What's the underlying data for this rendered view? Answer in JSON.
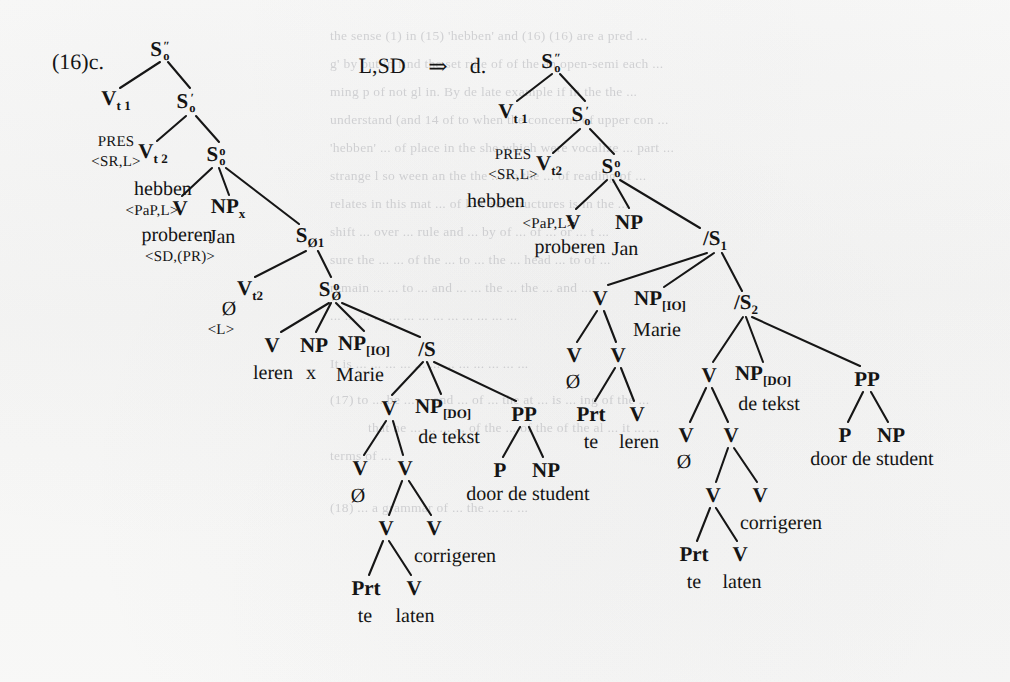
{
  "page": {
    "example_number": "(16)c.",
    "derivation_label": "L,SD",
    "derivation_arrow": "⇒",
    "result_label": "d.",
    "background_color": "#f7f7f6",
    "ink_color": "#141414"
  },
  "ghost_text": {
    "note": "faint bleed-through text from reverse page, illegible",
    "lines": [
      "the sense (1) in (15) 'hebben' and (16) (16) are a pred ...",
      "g' by but in find the set rule of of the an open-semi each ...",
      "ming p of not gl in. By de late example if in the the ...",
      "understand (and 14 of to when the concerns of upper con ...",
      "'hebben' ... of place in the she which were vocalize ... part ...",
      "strange l so ween an the the ... so the ... of reading of ...",
      "relates in this mat ... of low set structures is in the ...",
      "shift ... over ... rule and ... by of ... of ... or ... t ...",
      "sure the ... ... of the ... to ... the ... head ... to of ...",
      "remain ... ... to ... and ... ... the ... the ... and ...",
      "... ... ... ... ... ... ... ... ... ... ... ... ...",
      "It is ... ... ... ... ... ... ... ... ... ... ... ...",
      "(17) to ... be ... ... and ... of ... the at ... is ... ing of the ...",
      "that he ... ... ... ... of the ... of the of the al ... it ... ...",
      "terms of ...",
      "(18) ... a grammar of ... the ... ... ..."
    ]
  },
  "trees": {
    "left": {
      "name": "tree-16c",
      "nodes": [
        {
          "id": "l-S2",
          "label_html": "S<span class=\"stack\"><span class=\"up\">″</span><span class=\"down\">o</span></span>",
          "text": "S″o",
          "x": 160,
          "y": 50
        },
        {
          "id": "l-Vt1",
          "label_html": "V<span class=\"sub\">t</span><span class=\"sub\"> 1</span>",
          "text": "Vt1",
          "x": 116,
          "y": 100
        },
        {
          "id": "l-S1",
          "label_html": "S<span class=\"stack\"><span class=\"up\">′</span><span class=\"down\">o</span></span>",
          "text": "S′o",
          "x": 186,
          "y": 102
        },
        {
          "id": "l-Vt2",
          "label_html": "V<span class=\"sub\">t</span><span class=\"sub\"> 2</span>",
          "text": "Vt2",
          "x": 153,
          "y": 153
        },
        {
          "id": "l-S0",
          "label_html": "S<span class=\"stack\"><span class=\"up\">o</span><span class=\"down\">o</span></span>",
          "text": "S°o",
          "x": 216,
          "y": 155
        },
        {
          "id": "l-V1",
          "label_html": "V",
          "text": "V",
          "x": 180,
          "y": 208
        },
        {
          "id": "l-NPJan",
          "label_html": "NP<span class=\"sub\">x</span>",
          "text": "NPx",
          "x": 228,
          "y": 208
        },
        {
          "id": "l-Sp1",
          "label_html": "S<span class=\"sub\">Ø</span><span class=\"sub\">1</span>",
          "text": "S′Ø1",
          "x": 310,
          "y": 237
        },
        {
          "id": "l-Vt2b",
          "label_html": "V<span class=\"sub\">t</span><span class=\"sub\">2</span>",
          "text": "Vt2",
          "x": 250,
          "y": 290
        },
        {
          "id": "l-S0b",
          "label_html": "S<span class=\"stack\"><span class=\"up\">o</span><span class=\"down\">Ø</span></span>",
          "text": "S°Ø",
          "x": 330,
          "y": 290
        },
        {
          "id": "l-V2",
          "label_html": "V",
          "text": "V",
          "x": 272,
          "y": 345
        },
        {
          "id": "l-NPx2",
          "label_html": "NP",
          "text": "NP",
          "x": 314,
          "y": 345
        },
        {
          "id": "l-NPio",
          "label_html": "NP<span class=\"sub\">[IO]</span>",
          "text": "NP[IO]",
          "x": 364,
          "y": 345
        },
        {
          "id": "l-S3",
          "label_html": "/S",
          "text": "/S",
          "x": 427,
          "y": 349
        },
        {
          "id": "l-V3",
          "label_html": "V",
          "text": "V",
          "x": 389,
          "y": 408
        },
        {
          "id": "l-NPdo",
          "label_html": "NP<span class=\"sub\">[DO]</span>",
          "text": "NP[DO]",
          "x": 443,
          "y": 408
        },
        {
          "id": "l-PP",
          "label_html": "PP",
          "text": "PP",
          "x": 524,
          "y": 414
        },
        {
          "id": "l-V4",
          "label_html": "V",
          "text": "V",
          "x": 360,
          "y": 468
        },
        {
          "id": "l-V5",
          "label_html": "V",
          "text": "V",
          "x": 405,
          "y": 468
        },
        {
          "id": "l-P",
          "label_html": "P",
          "text": "P",
          "x": 500,
          "y": 470
        },
        {
          "id": "l-NPpp",
          "label_html": "NP",
          "text": "NP",
          "x": 546,
          "y": 470
        },
        {
          "id": "l-V6",
          "label_html": "V",
          "text": "V",
          "x": 386,
          "y": 528
        },
        {
          "id": "l-V7",
          "label_html": "V",
          "text": "V",
          "x": 434,
          "y": 528
        },
        {
          "id": "l-Prt",
          "label_html": "Prt",
          "text": "Prt",
          "x": 366,
          "y": 588
        },
        {
          "id": "l-V8",
          "label_html": "V",
          "text": "V",
          "x": 414,
          "y": 588
        }
      ],
      "edges": [
        [
          160,
          62,
          120,
          88
        ],
        [
          168,
          62,
          190,
          88
        ],
        [
          186,
          116,
          157,
          141
        ],
        [
          196,
          116,
          219,
          142
        ],
        [
          212,
          168,
          182,
          196
        ],
        [
          219,
          168,
          229,
          195
        ],
        [
          226,
          168,
          299,
          224
        ],
        [
          306,
          251,
          255,
          277
        ],
        [
          318,
          251,
          331,
          277
        ],
        [
          329,
          303,
          281,
          332
        ],
        [
          331,
          303,
          316,
          332
        ],
        [
          336,
          303,
          364,
          331
        ],
        [
          342,
          303,
          420,
          337
        ],
        [
          423,
          362,
          392,
          395
        ],
        [
          427,
          362,
          441,
          394
        ],
        [
          434,
          362,
          516,
          401
        ],
        [
          386,
          421,
          364,
          455
        ],
        [
          393,
          421,
          403,
          455
        ],
        [
          520,
          427,
          503,
          457
        ],
        [
          529,
          427,
          543,
          457
        ],
        [
          402,
          481,
          389,
          515
        ],
        [
          409,
          481,
          431,
          515
        ],
        [
          383,
          541,
          369,
          575
        ],
        [
          389,
          541,
          411,
          575
        ]
      ],
      "word_labels": [
        {
          "id": "l-w-hebben",
          "text": "hebben",
          "x": 163,
          "y": 189
        },
        {
          "id": "l-w-proberen",
          "text": "proberen",
          "x": 177,
          "y": 235
        },
        {
          "id": "l-w-Jan",
          "text": "Jan",
          "x": 222,
          "y": 237
        },
        {
          "id": "l-w-leren",
          "text": "leren",
          "x": 273,
          "y": 373
        },
        {
          "id": "l-w-x",
          "text": "x",
          "x": 311,
          "y": 373
        },
        {
          "id": "l-w-Marie",
          "text": "Marie",
          "x": 360,
          "y": 375
        },
        {
          "id": "l-w-detekst",
          "text": "de tekst",
          "x": 449,
          "y": 437
        },
        {
          "id": "l-w-doordestudent",
          "text": "door de student",
          "x": 528,
          "y": 494
        },
        {
          "id": "l-w-corrigeren",
          "text": "corrigeren",
          "x": 455,
          "y": 556
        },
        {
          "id": "l-w-te",
          "text": "te",
          "x": 365,
          "y": 616
        },
        {
          "id": "l-w-laten",
          "text": "laten",
          "x": 415,
          "y": 616
        },
        {
          "id": "l-w-empty1",
          "text": "Ø",
          "x": 229,
          "y": 309
        },
        {
          "id": "l-w-empty2",
          "text": "Ø",
          "x": 358,
          "y": 496
        }
      ],
      "feature_labels": [
        {
          "id": "l-f-pres",
          "text": "PRES",
          "x": 116,
          "y": 142
        },
        {
          "id": "l-f-srl",
          "text": "<SR,L>",
          "x": 116,
          "y": 162
        },
        {
          "id": "l-f-papl",
          "text": "<PaP,L>",
          "x": 152,
          "y": 211
        },
        {
          "id": "l-f-sdpr",
          "text": "<SD,(PR)>",
          "x": 180,
          "y": 257
        },
        {
          "id": "l-f-L",
          "text": "<L>",
          "x": 221,
          "y": 330
        }
      ]
    },
    "right": {
      "name": "tree-16d",
      "nodes": [
        {
          "id": "r-S2",
          "label_html": "S<span class=\"stack\"><span class=\"up\">″</span><span class=\"down\">o</span></span>",
          "text": "S″o",
          "x": 551,
          "y": 62
        },
        {
          "id": "r-Vt1",
          "label_html": "V<span class=\"sub\">t</span><span class=\"sub\"> 1</span>",
          "text": "Vt1",
          "x": 513,
          "y": 113
        },
        {
          "id": "r-S1",
          "label_html": "S<span class=\"stack\"><span class=\"up\">′</span><span class=\"down\">o</span></span>",
          "text": "S′o",
          "x": 581,
          "y": 115
        },
        {
          "id": "r-Vt2",
          "label_html": "V<span class=\"sub\">t</span><span class=\"sub\">2</span>",
          "text": "Vt2",
          "x": 549,
          "y": 165
        },
        {
          "id": "r-S0",
          "label_html": "S<span class=\"stack\"><span class=\"up\">o</span><span class=\"down\">o</span></span>",
          "text": "S°o",
          "x": 611,
          "y": 167
        },
        {
          "id": "r-V1",
          "label_html": "V",
          "text": "V",
          "x": 573,
          "y": 222
        },
        {
          "id": "r-NPJan",
          "label_html": "NP",
          "text": "NP",
          "x": 629,
          "y": 222
        },
        {
          "id": "r-Ss1",
          "label_html": "/S<span class=\"sub\">1</span>",
          "text": "/S1",
          "x": 715,
          "y": 240
        },
        {
          "id": "r-V2",
          "label_html": "V",
          "text": "V",
          "x": 600,
          "y": 298
        },
        {
          "id": "r-NPio",
          "label_html": "NP<span class=\"sub\">[IO]</span>",
          "text": "NP[IO]",
          "x": 660,
          "y": 300
        },
        {
          "id": "r-Ss2",
          "label_html": "/S<span class=\"sub\">2</span>",
          "text": "/S2",
          "x": 746,
          "y": 304
        },
        {
          "id": "r-V3",
          "label_html": "V",
          "text": "V",
          "x": 574,
          "y": 355
        },
        {
          "id": "r-V4",
          "label_html": "V",
          "text": "V",
          "x": 618,
          "y": 355
        },
        {
          "id": "r-V5",
          "label_html": "V",
          "text": "V",
          "x": 709,
          "y": 375
        },
        {
          "id": "r-NPdo",
          "label_html": "NP<span class=\"sub\">[DO]</span>",
          "text": "NP[DO]",
          "x": 763,
          "y": 375
        },
        {
          "id": "r-PP",
          "label_html": "PP",
          "text": "PP",
          "x": 867,
          "y": 379
        },
        {
          "id": "r-Prt1",
          "label_html": "Prt",
          "text": "Prt",
          "x": 591,
          "y": 414
        },
        {
          "id": "r-V6",
          "label_html": "V",
          "text": "V",
          "x": 637,
          "y": 414
        },
        {
          "id": "r-V7",
          "label_html": "V",
          "text": "V",
          "x": 686,
          "y": 435
        },
        {
          "id": "r-V8",
          "label_html": "V",
          "text": "V",
          "x": 731,
          "y": 435
        },
        {
          "id": "r-P",
          "label_html": "P",
          "text": "P",
          "x": 845,
          "y": 435
        },
        {
          "id": "r-NPpp",
          "label_html": "NP",
          "text": "NP",
          "x": 891,
          "y": 435
        },
        {
          "id": "r-V9",
          "label_html": "V",
          "text": "V",
          "x": 713,
          "y": 495
        },
        {
          "id": "r-V10",
          "label_html": "V",
          "text": "V",
          "x": 760,
          "y": 495
        },
        {
          "id": "r-Prt2",
          "label_html": "Prt",
          "text": "Prt",
          "x": 694,
          "y": 554
        },
        {
          "id": "r-V11",
          "label_html": "V",
          "text": "V",
          "x": 740,
          "y": 554
        }
      ],
      "edges": [
        [
          552,
          74,
          517,
          101
        ],
        [
          560,
          74,
          585,
          101
        ],
        [
          580,
          129,
          553,
          153
        ],
        [
          590,
          129,
          614,
          154
        ],
        [
          607,
          180,
          576,
          209
        ],
        [
          613,
          180,
          629,
          208
        ],
        [
          620,
          180,
          700,
          228
        ],
        [
          707,
          253,
          608,
          285
        ],
        [
          714,
          253,
          664,
          287
        ],
        [
          722,
          253,
          742,
          291
        ],
        [
          597,
          311,
          577,
          342
        ],
        [
          604,
          311,
          616,
          342
        ],
        [
          743,
          317,
          713,
          362
        ],
        [
          746,
          317,
          763,
          362
        ],
        [
          752,
          317,
          860,
          366
        ],
        [
          615,
          368,
          595,
          401
        ],
        [
          621,
          368,
          634,
          401
        ],
        [
          863,
          392,
          848,
          422
        ],
        [
          871,
          392,
          888,
          422
        ],
        [
          706,
          388,
          690,
          422
        ],
        [
          712,
          388,
          728,
          422
        ],
        [
          728,
          448,
          716,
          482
        ],
        [
          734,
          448,
          757,
          482
        ],
        [
          710,
          508,
          697,
          541
        ],
        [
          716,
          508,
          737,
          541
        ]
      ],
      "word_labels": [
        {
          "id": "r-w-hebben",
          "text": "hebben",
          "x": 496,
          "y": 201
        },
        {
          "id": "r-w-proberen",
          "text": "proberen",
          "x": 570,
          "y": 247
        },
        {
          "id": "r-w-Jan",
          "text": "Jan",
          "x": 625,
          "y": 249
        },
        {
          "id": "r-w-Marie",
          "text": "Marie",
          "x": 657,
          "y": 330
        },
        {
          "id": "r-w-empty1",
          "text": "Ø",
          "x": 573,
          "y": 382
        },
        {
          "id": "r-w-te1",
          "text": "te",
          "x": 591,
          "y": 442
        },
        {
          "id": "r-w-leren",
          "text": "leren",
          "x": 639,
          "y": 442
        },
        {
          "id": "r-w-detekst",
          "text": "de tekst",
          "x": 769,
          "y": 404
        },
        {
          "id": "r-w-empty2",
          "text": "Ø",
          "x": 684,
          "y": 462
        },
        {
          "id": "r-w-corrigeren",
          "text": "corrigeren",
          "x": 781,
          "y": 523
        },
        {
          "id": "r-w-te2",
          "text": "te",
          "x": 694,
          "y": 582
        },
        {
          "id": "r-w-laten",
          "text": "laten",
          "x": 742,
          "y": 582
        },
        {
          "id": "r-w-doordestudent",
          "text": "door de student",
          "x": 872,
          "y": 459
        }
      ],
      "feature_labels": [
        {
          "id": "r-f-pres",
          "text": "PRES",
          "x": 513,
          "y": 155
        },
        {
          "id": "r-f-srl",
          "text": "<SR,L>",
          "x": 513,
          "y": 175
        },
        {
          "id": "r-f-papl",
          "text": "<PaP,L>",
          "x": 549,
          "y": 224
        }
      ]
    }
  },
  "header_items": [
    {
      "id": "example-number",
      "text": "(16)c.",
      "x": 78,
      "y": 62
    },
    {
      "id": "derivation-label",
      "text": "L,SD",
      "x": 382,
      "y": 66
    },
    {
      "id": "derivation-arrow",
      "text": "⇒",
      "x": 438,
      "y": 66
    },
    {
      "id": "result-label",
      "text": "d.",
      "x": 478,
      "y": 66
    }
  ]
}
